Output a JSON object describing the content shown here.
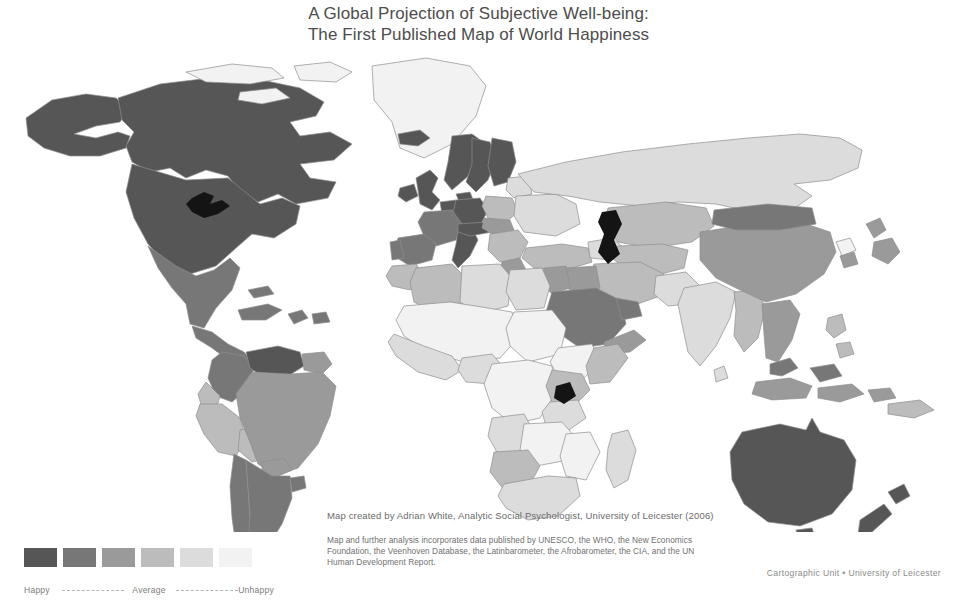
{
  "title": {
    "line1": "A Global Projection of Subjective Well-being:",
    "line2": "The First Published Map of World Happiness"
  },
  "credits": {
    "author": "Map created by Adrian White, Analytic Social Psychologist, University of Leicester (2006)",
    "sources_line1": "Map and further analysis incorporates data published by UNESCO, the WHO, the New Economics",
    "sources_line2": "Foundation, the Veenhoven Database, the Latinbarometer, the Afrobarometer, the CIA, and the UN",
    "sources_line3": "Human Development Report.",
    "cartographic": "Cartographic Unit • University of Leicester"
  },
  "legend": {
    "happy_label": "Happy",
    "average_label": "Average",
    "unhappy_label": "Unhappy",
    "swatches": [
      {
        "rank": 1,
        "level": "happiest",
        "color": "#565656"
      },
      {
        "rank": 2,
        "level": "happy",
        "color": "#777777"
      },
      {
        "rank": 3,
        "level": "moderately-happy",
        "color": "#9a9a9a"
      },
      {
        "rank": 4,
        "level": "moderately-unhappy",
        "color": "#bcbcbc"
      },
      {
        "rank": 5,
        "level": "unhappy",
        "color": "#dcdcdc"
      },
      {
        "rank": 6,
        "level": "unhappiest",
        "color": "#f2f2f2"
      }
    ]
  },
  "chart_data": {
    "type": "map",
    "title": "A Global Projection of Subjective Well-being: The First Published Map of World Happiness",
    "projection": "world-equirectangular",
    "scale_name": "Subjective Well-being (Happiness)",
    "scale_direction": "dark = happy, light = unhappy",
    "scale_colors": [
      "#565656",
      "#777777",
      "#9a9a9a",
      "#bcbcbc",
      "#dcdcdc",
      "#f2f2f2"
    ],
    "scale_labels": [
      "Happy",
      "",
      "",
      "",
      "",
      "Unhappy"
    ],
    "regions": [
      {
        "name": "Canada",
        "rank": 1,
        "color": "#565656"
      },
      {
        "name": "United States",
        "rank": 1,
        "color": "#565656"
      },
      {
        "name": "Alaska",
        "rank": 1,
        "color": "#565656"
      },
      {
        "name": "Greenland",
        "rank": 6,
        "color": "#f2f2f2"
      },
      {
        "name": "Mexico",
        "rank": 2,
        "color": "#777777"
      },
      {
        "name": "Central America",
        "rank": 2,
        "color": "#777777"
      },
      {
        "name": "Caribbean",
        "rank": 2,
        "color": "#777777"
      },
      {
        "name": "Colombia",
        "rank": 2,
        "color": "#777777"
      },
      {
        "name": "Venezuela",
        "rank": 1,
        "color": "#565656"
      },
      {
        "name": "Guianas",
        "rank": 3,
        "color": "#9a9a9a"
      },
      {
        "name": "Ecuador",
        "rank": 4,
        "color": "#bcbcbc"
      },
      {
        "name": "Peru",
        "rank": 4,
        "color": "#bcbcbc"
      },
      {
        "name": "Bolivia",
        "rank": 4,
        "color": "#bcbcbc"
      },
      {
        "name": "Brazil",
        "rank": 3,
        "color": "#9a9a9a"
      },
      {
        "name": "Paraguay",
        "rank": 3,
        "color": "#9a9a9a"
      },
      {
        "name": "Chile",
        "rank": 2,
        "color": "#777777"
      },
      {
        "name": "Argentina",
        "rank": 2,
        "color": "#777777"
      },
      {
        "name": "Uruguay",
        "rank": 2,
        "color": "#777777"
      },
      {
        "name": "United Kingdom",
        "rank": 1,
        "color": "#565656"
      },
      {
        "name": "Ireland",
        "rank": 1,
        "color": "#565656"
      },
      {
        "name": "Iceland",
        "rank": 1,
        "color": "#565656"
      },
      {
        "name": "Norway",
        "rank": 1,
        "color": "#565656"
      },
      {
        "name": "Sweden",
        "rank": 1,
        "color": "#565656"
      },
      {
        "name": "Finland",
        "rank": 1,
        "color": "#565656"
      },
      {
        "name": "Denmark",
        "rank": 1,
        "color": "#565656"
      },
      {
        "name": "Germany",
        "rank": 1,
        "color": "#565656"
      },
      {
        "name": "Netherlands",
        "rank": 1,
        "color": "#565656"
      },
      {
        "name": "Belgium",
        "rank": 1,
        "color": "#565656"
      },
      {
        "name": "France",
        "rank": 2,
        "color": "#777777"
      },
      {
        "name": "Spain",
        "rank": 2,
        "color": "#777777"
      },
      {
        "name": "Portugal",
        "rank": 2,
        "color": "#777777"
      },
      {
        "name": "Italy",
        "rank": 1,
        "color": "#565656"
      },
      {
        "name": "Switzerland",
        "rank": 1,
        "color": "#565656"
      },
      {
        "name": "Austria",
        "rank": 1,
        "color": "#565656"
      },
      {
        "name": "Poland",
        "rank": 4,
        "color": "#bcbcbc"
      },
      {
        "name": "Czechia and Slovakia",
        "rank": 3,
        "color": "#9a9a9a"
      },
      {
        "name": "Hungary",
        "rank": 4,
        "color": "#bcbcbc"
      },
      {
        "name": "Balkans",
        "rank": 4,
        "color": "#bcbcbc"
      },
      {
        "name": "Greece",
        "rank": 3,
        "color": "#9a9a9a"
      },
      {
        "name": "Baltic States",
        "rank": 5,
        "color": "#dcdcdc"
      },
      {
        "name": "Belarus",
        "rank": 5,
        "color": "#dcdcdc"
      },
      {
        "name": "Ukraine",
        "rank": 5,
        "color": "#dcdcdc"
      },
      {
        "name": "Russia",
        "rank": 5,
        "color": "#dcdcdc"
      },
      {
        "name": "Turkey",
        "rank": 4,
        "color": "#bcbcbc"
      },
      {
        "name": "Caucasus",
        "rank": 5,
        "color": "#dcdcdc"
      },
      {
        "name": "Kazakhstan",
        "rank": 4,
        "color": "#bcbcbc"
      },
      {
        "name": "Central Asia",
        "rank": 4,
        "color": "#bcbcbc"
      },
      {
        "name": "Iran",
        "rank": 4,
        "color": "#bcbcbc"
      },
      {
        "name": "Iraq",
        "rank": 3,
        "color": "#9a9a9a"
      },
      {
        "name": "Saudi Arabia",
        "rank": 2,
        "color": "#777777"
      },
      {
        "name": "Gulf States",
        "rank": 2,
        "color": "#777777"
      },
      {
        "name": "Yemen",
        "rank": 3,
        "color": "#9a9a9a"
      },
      {
        "name": "Israel and Levant",
        "rank": 3,
        "color": "#9a9a9a"
      },
      {
        "name": "Egypt",
        "rank": 5,
        "color": "#dcdcdc"
      },
      {
        "name": "Libya",
        "rank": 5,
        "color": "#dcdcdc"
      },
      {
        "name": "Algeria",
        "rank": 4,
        "color": "#bcbcbc"
      },
      {
        "name": "Morocco",
        "rank": 4,
        "color": "#bcbcbc"
      },
      {
        "name": "Tunisia",
        "rank": 4,
        "color": "#bcbcbc"
      },
      {
        "name": "Sahel",
        "rank": 6,
        "color": "#f2f2f2"
      },
      {
        "name": "West Africa",
        "rank": 5,
        "color": "#dcdcdc"
      },
      {
        "name": "Nigeria",
        "rank": 5,
        "color": "#dcdcdc"
      },
      {
        "name": "Sudan",
        "rank": 6,
        "color": "#f2f2f2"
      },
      {
        "name": "Ethiopia",
        "rank": 6,
        "color": "#f2f2f2"
      },
      {
        "name": "Somalia",
        "rank": 4,
        "color": "#bcbcbc"
      },
      {
        "name": "Kenya",
        "rank": 4,
        "color": "#bcbcbc"
      },
      {
        "name": "Tanzania",
        "rank": 5,
        "color": "#dcdcdc"
      },
      {
        "name": "Democratic Republic of the Congo",
        "rank": 6,
        "color": "#f2f2f2"
      },
      {
        "name": "Angola",
        "rank": 5,
        "color": "#dcdcdc"
      },
      {
        "name": "Zambia",
        "rank": 6,
        "color": "#f2f2f2"
      },
      {
        "name": "Zimbabwe",
        "rank": 6,
        "color": "#f2f2f2"
      },
      {
        "name": "Mozambique",
        "rank": 6,
        "color": "#f2f2f2"
      },
      {
        "name": "Madagascar",
        "rank": 5,
        "color": "#dcdcdc"
      },
      {
        "name": "South Africa",
        "rank": 5,
        "color": "#dcdcdc"
      },
      {
        "name": "Namibia",
        "rank": 4,
        "color": "#bcbcbc"
      },
      {
        "name": "India",
        "rank": 5,
        "color": "#dcdcdc"
      },
      {
        "name": "Pakistan",
        "rank": 5,
        "color": "#dcdcdc"
      },
      {
        "name": "Bangladesh",
        "rank": 4,
        "color": "#bcbcbc"
      },
      {
        "name": "Sri Lanka",
        "rank": 5,
        "color": "#dcdcdc"
      },
      {
        "name": "China",
        "rank": 3,
        "color": "#9a9a9a"
      },
      {
        "name": "Mongolia",
        "rank": 2,
        "color": "#777777"
      },
      {
        "name": "Japan",
        "rank": 3,
        "color": "#9a9a9a"
      },
      {
        "name": "South Korea",
        "rank": 3,
        "color": "#9a9a9a"
      },
      {
        "name": "North Korea",
        "rank": 6,
        "color": "#f2f2f2"
      },
      {
        "name": "Thailand",
        "rank": 3,
        "color": "#9a9a9a"
      },
      {
        "name": "Vietnam",
        "rank": 3,
        "color": "#9a9a9a"
      },
      {
        "name": "Myanmar",
        "rank": 4,
        "color": "#bcbcbc"
      },
      {
        "name": "Malaysia",
        "rank": 2,
        "color": "#777777"
      },
      {
        "name": "Indonesia",
        "rank": 3,
        "color": "#9a9a9a"
      },
      {
        "name": "Philippines",
        "rank": 4,
        "color": "#bcbcbc"
      },
      {
        "name": "Papua New Guinea",
        "rank": 4,
        "color": "#bcbcbc"
      },
      {
        "name": "Australia",
        "rank": 1,
        "color": "#565656"
      },
      {
        "name": "New Zealand",
        "rank": 1,
        "color": "#565656"
      }
    ],
    "water_features": [
      "Great Lakes",
      "Caspian Sea",
      "Lake Victoria"
    ]
  }
}
